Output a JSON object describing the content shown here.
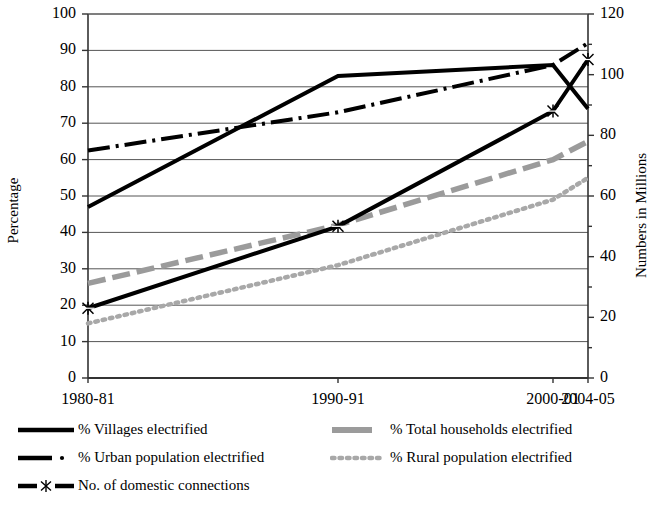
{
  "axes": {
    "left_title": "Percentage",
    "right_title": "Numbers in Millions",
    "left_ticks": [
      "0",
      "10",
      "20",
      "30",
      "40",
      "50",
      "60",
      "70",
      "80",
      "90",
      "100"
    ],
    "right_ticks": [
      "0",
      "20",
      "40",
      "60",
      "80",
      "100",
      "120"
    ],
    "x_ticks": [
      "1980-81",
      "1990-91",
      "2000-01",
      "2004-05"
    ]
  },
  "legend": {
    "items": [
      {
        "label": "% Villages electrified",
        "key": "solid-black"
      },
      {
        "label": "% Total households electrified",
        "key": "dash-grey"
      },
      {
        "label": "% Urban population electrified",
        "key": "dashdot-black"
      },
      {
        "label": "% Rural population electrified",
        "key": "dotted-grey"
      },
      {
        "label": "No. of domestic connections",
        "key": "marker-black"
      }
    ]
  },
  "chart_data": {
    "type": "line",
    "title": "",
    "xlabel": "",
    "ylabel": "Percentage",
    "y2label": "Numbers in Millions",
    "categories": [
      "1980-81",
      "1990-91",
      "2000-01",
      "2004-05"
    ],
    "x_positions": [
      0,
      0.5,
      0.93,
      1.0
    ],
    "ylim": [
      0,
      100
    ],
    "y2lim": [
      0,
      120
    ],
    "ytick_step": 10,
    "y2tick_step": 20,
    "grid": true,
    "legend_position": "bottom",
    "series": [
      {
        "name": "% Villages electrified",
        "axis": "left",
        "style": "solid",
        "color": "#000000",
        "values": [
          47,
          83,
          86,
          74
        ]
      },
      {
        "name": "% Urban population electrified",
        "axis": "left",
        "style": "dashdot",
        "color": "#000000",
        "values": [
          62.5,
          73,
          86,
          92
        ]
      },
      {
        "name": "% Total households electrified",
        "axis": "left",
        "style": "dashed",
        "color": "#9b9b9b",
        "values": [
          26,
          42,
          60,
          65
        ]
      },
      {
        "name": "% Rural population electrified",
        "axis": "left",
        "style": "dotted",
        "color": "#a8a8a8",
        "values": [
          15,
          31,
          49,
          55
        ]
      },
      {
        "name": "No. of domestic connections",
        "axis": "right",
        "style": "solid-marker",
        "color": "#000000",
        "marker": "x-star",
        "values": [
          23,
          50,
          88,
          105
        ]
      }
    ]
  }
}
